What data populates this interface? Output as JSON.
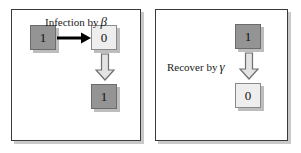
{
  "figure": {
    "panels": [
      {
        "id": "infection-panel",
        "caption_text": "Infection by",
        "caption_symbol": "β",
        "cells": [
          {
            "name": "source-infected-cell",
            "value": "1",
            "state": "infected"
          },
          {
            "name": "target-susceptible-cell",
            "value": "0",
            "state": "susceptible"
          },
          {
            "name": "result-infected-cell",
            "value": "1",
            "state": "infected"
          }
        ],
        "arrows": [
          {
            "name": "infection-transmission-arrow",
            "direction": "right",
            "style": "solid-line"
          },
          {
            "name": "infection-state-change-arrow",
            "direction": "down",
            "style": "block-outline"
          }
        ]
      },
      {
        "id": "recovery-panel",
        "caption_text": "Recover by",
        "caption_symbol": "γ",
        "cells": [
          {
            "name": "infected-cell",
            "value": "1",
            "state": "infected"
          },
          {
            "name": "recovered-cell",
            "value": "0",
            "state": "susceptible"
          }
        ],
        "arrows": [
          {
            "name": "recovery-state-change-arrow",
            "direction": "down",
            "style": "block-outline"
          }
        ]
      }
    ]
  },
  "colors": {
    "infected_fill": "#949494",
    "susceptible_fill": "#eeeeee",
    "cell_border": "#6b6b6b",
    "panel_border": "#3a3a3a",
    "shadow": "#c9c9c9",
    "arrow_solid": "#000000",
    "arrow_block_fill": "#e3e3e3",
    "arrow_block_stroke": "#6f6f6f",
    "text": "#1a1a1a"
  }
}
